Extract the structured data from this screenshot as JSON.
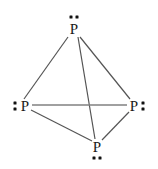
{
  "figure": {
    "molecule_formula": "P4",
    "background_color": "#ffffff",
    "bond_color": "#555555",
    "horizontal_bond_color": "#808080",
    "atom_color": "#1a1a1a",
    "dot_color": "#111111",
    "width": 158,
    "height": 169
  },
  "atoms": [
    {
      "id": "p-top",
      "label": "P",
      "x": 74,
      "y": 29,
      "lone_pair": {
        "orientation": "horizontal",
        "dots": 2,
        "x": 74,
        "y": 17
      }
    },
    {
      "id": "p-left",
      "label": "P",
      "x": 25,
      "y": 106,
      "lone_pair": {
        "orientation": "vertical",
        "dots": 2,
        "x": 15,
        "y": 106
      }
    },
    {
      "id": "p-right",
      "label": "P",
      "x": 134,
      "y": 106,
      "lone_pair": {
        "orientation": "vertical",
        "dots": 2,
        "x": 143,
        "y": 106
      }
    },
    {
      "id": "p-bottom",
      "label": "P",
      "x": 97,
      "y": 147,
      "lone_pair": {
        "orientation": "horizontal",
        "dots": 2,
        "x": 97,
        "y": 158
      }
    }
  ],
  "bonds": [
    {
      "id": "bond-top-left",
      "from": "p-top",
      "to": "p-left",
      "x1": 68,
      "y1": 37,
      "x2": 24,
      "y2": 99,
      "color": "#555555",
      "width": 1.2
    },
    {
      "id": "bond-top-right",
      "from": "p-top",
      "to": "p-right",
      "x1": 80,
      "y1": 37,
      "x2": 130,
      "y2": 99,
      "color": "#555555",
      "width": 1.2
    },
    {
      "id": "bond-top-bottom",
      "from": "p-top",
      "to": "p-bottom",
      "x1": 78,
      "y1": 37,
      "x2": 95,
      "y2": 139,
      "color": "#555555",
      "width": 1.2
    },
    {
      "id": "bond-left-right",
      "from": "p-left",
      "to": "p-right",
      "x1": 32,
      "y1": 105,
      "x2": 127,
      "y2": 105,
      "color": "#808080",
      "width": 1.6
    },
    {
      "id": "bond-left-bottom",
      "from": "p-left",
      "to": "p-bottom",
      "x1": 31,
      "y1": 110,
      "x2": 92,
      "y2": 141,
      "color": "#555555",
      "width": 1.2
    },
    {
      "id": "bond-right-bottom",
      "from": "p-right",
      "to": "p-bottom",
      "x1": 129,
      "y1": 112,
      "x2": 102,
      "y2": 140,
      "color": "#555555",
      "width": 1.2
    }
  ]
}
